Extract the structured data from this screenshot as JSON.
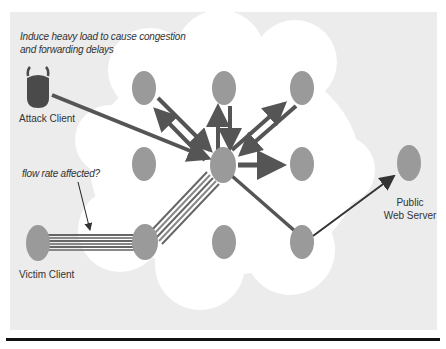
{
  "annotations": {
    "top_note": [
      "Induce heavy load to cause congestion",
      "and forwarding delays"
    ],
    "flow_note": "flow rate affected?"
  },
  "nodes": {
    "attack_client": {
      "label": "Attack Client",
      "x": 38,
      "y": 91,
      "color": "#4a4a4a"
    },
    "victim_client": {
      "label": "Victim Client",
      "x": 38,
      "y": 243,
      "color": "#9a9a9a"
    },
    "public_web_server": {
      "label_line1": "Public",
      "label_line2": "Web Server",
      "x": 409,
      "y": 163,
      "color": "#9a9a9a"
    },
    "cloud_nodes": [
      {
        "id": "n_top_left",
        "x": 144,
        "y": 88
      },
      {
        "id": "n_top_mid",
        "x": 224,
        "y": 88
      },
      {
        "id": "n_top_right",
        "x": 302,
        "y": 88
      },
      {
        "id": "n_mid_left",
        "x": 144,
        "y": 164
      },
      {
        "id": "n_hub",
        "x": 223,
        "y": 165
      },
      {
        "id": "n_mid_right",
        "x": 302,
        "y": 164
      },
      {
        "id": "n_bot_left",
        "x": 145,
        "y": 242
      },
      {
        "id": "n_bot_mid",
        "x": 224,
        "y": 242
      },
      {
        "id": "n_bot_right",
        "x": 302,
        "y": 242
      }
    ]
  },
  "colors": {
    "panel": "#ececec",
    "cloud": "#ffffff",
    "node": "#9a9a9a",
    "edge": "#555555",
    "rule": "#111111"
  }
}
